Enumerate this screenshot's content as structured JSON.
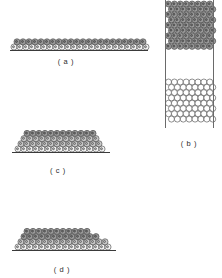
{
  "figure": {
    "type": "scientific-illustration",
    "background_color": "#ffffff",
    "ink_color": "#333333",
    "panels": [
      {
        "id": "a",
        "label": "( a )",
        "label_x": 66,
        "label_y": 57,
        "description": "continuous flat two-layer film resting on a substrate line",
        "substrate": {
          "x": 10,
          "y": 50,
          "width": 138
        },
        "atom_radius": 3.05,
        "row_pitch_x": 6.0,
        "row_pitch_y": 5.3,
        "rows": [
          {
            "y": 47.0,
            "x_start": 14.0,
            "count": 23,
            "offset": 0.0,
            "shade": "light"
          },
          {
            "y": 41.8,
            "x_start": 17.0,
            "count": 22,
            "offset": 3.0,
            "shade": "dark"
          }
        ]
      },
      {
        "id": "b",
        "label": "( b )",
        "label_x": 189,
        "label_y": 139,
        "description": "vertical column: dense shaded cluster at top, empty gap, open-circle lattice below, bounded by two vertical walls",
        "walls": [
          {
            "x": 165,
            "y": 0,
            "height": 128
          },
          {
            "x": 213,
            "y": 0,
            "height": 128
          }
        ],
        "atom_radius": 3.0,
        "top_block": {
          "shade": "dark",
          "y_start": 4.0,
          "x_start": 168.5,
          "cols": 8,
          "rows": 9,
          "pitch_x": 5.9,
          "pitch_y": 5.3,
          "stagger": 2.95
        },
        "bottom_block": {
          "shade": "open",
          "y_start": 82.0,
          "x_start": 168.5,
          "cols": 8,
          "rows": 8,
          "pitch_x": 5.9,
          "pitch_y": 5.3,
          "stagger": 2.95
        },
        "gap": {
          "y_top": 54,
          "y_bottom": 80
        }
      },
      {
        "id": "c",
        "label": "( c )",
        "label_x": 58,
        "label_y": 166,
        "description": "symmetric trapezoidal island mound of four stacked rows on a substrate line",
        "substrate": {
          "x": 12,
          "y": 152,
          "width": 98
        },
        "atom_radius": 3.05,
        "rows": [
          {
            "y": 149.0,
            "x_start": 18.0,
            "count": 15,
            "offset": 0.0,
            "shade": "light"
          },
          {
            "y": 143.8,
            "x_start": 21.0,
            "count": 14,
            "offset": 3.0,
            "shade": "mid"
          },
          {
            "y": 138.6,
            "x_start": 24.0,
            "count": 13,
            "offset": 6.0,
            "shade": "mid"
          },
          {
            "y": 133.4,
            "x_start": 27.0,
            "count": 12,
            "offset": 9.0,
            "shade": "dark"
          }
        ]
      },
      {
        "id": "d",
        "label": "( d )",
        "label_x": 62,
        "label_y": 265,
        "description": "asymmetric island mound with a stepped, darker right flank on a substrate line",
        "substrate": {
          "x": 12,
          "y": 250,
          "width": 104
        },
        "atom_radius": 3.05,
        "rows": [
          {
            "y": 247.0,
            "x_start": 18.0,
            "count": 16,
            "offset": 0.0,
            "shade": "light"
          },
          {
            "y": 241.8,
            "x_start": 21.0,
            "count": 15,
            "offset": 3.0,
            "shade": "mid"
          },
          {
            "y": 236.6,
            "x_start": 24.0,
            "count": 13,
            "offset": 6.0,
            "shade": "dark"
          },
          {
            "y": 231.4,
            "x_start": 27.0,
            "count": 11,
            "offset": 9.0,
            "shade": "dark"
          }
        ]
      }
    ],
    "shades": {
      "open": {
        "fill": "#ffffff",
        "stroke": "#333333"
      },
      "light": {
        "fill": "#f2f2f2",
        "stroke": "#333333"
      },
      "mid": {
        "fill": "#c9c9c9",
        "stroke": "#333333"
      },
      "dark": {
        "fill": "#9a9a9a",
        "stroke": "#2b2b2b"
      }
    }
  }
}
